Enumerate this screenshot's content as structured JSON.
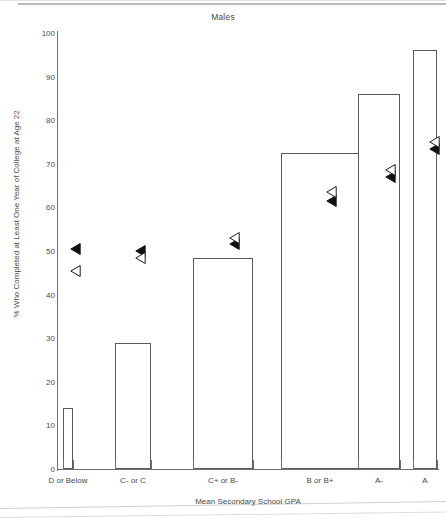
{
  "chart_data": {
    "type": "bar",
    "title": "Males",
    "xlabel": "Mean Secondary School GPA",
    "ylabel": "% Who Completed at Least One Year of College at Age 22",
    "categories": [
      "D or Below",
      "C- or C",
      "C+ or B-",
      "B or B+",
      "A-",
      "A"
    ],
    "values": [
      14,
      29,
      48.5,
      72.5,
      86,
      96
    ],
    "ylim": [
      0,
      100
    ],
    "yticks": [
      0,
      10,
      20,
      30,
      40,
      50,
      60,
      70,
      80,
      90,
      100
    ],
    "ytick_labels": [
      "0",
      "10",
      "20",
      "30",
      "40",
      "50",
      "60",
      "70",
      "80",
      "90",
      "100"
    ],
    "grid": false,
    "legend": "none",
    "series": [
      {
        "name": "bars",
        "marker": "bar",
        "values": [
          14,
          29,
          48.5,
          72.5,
          86,
          96
        ]
      },
      {
        "name": "filled-triangle-overlay",
        "marker": "filled-left-triangle",
        "values": [
          50.5,
          50,
          51.5,
          61.5,
          67,
          73.5
        ]
      },
      {
        "name": "open-triangle-overlay",
        "marker": "open-left-triangle",
        "values": [
          45.5,
          48.5,
          53,
          63.5,
          68.5,
          75
        ]
      }
    ],
    "bar_widths_px": [
      10,
      36,
      60,
      78,
      42,
      24
    ],
    "bar_edge_color": "#5a5a5a",
    "bar_fill_color": "#ffffff",
    "marker_filled_color": "#111111",
    "marker_open_color": "#ffffff",
    "axis_color": "#6f6f6f",
    "text_color": "#4a4a4a"
  }
}
